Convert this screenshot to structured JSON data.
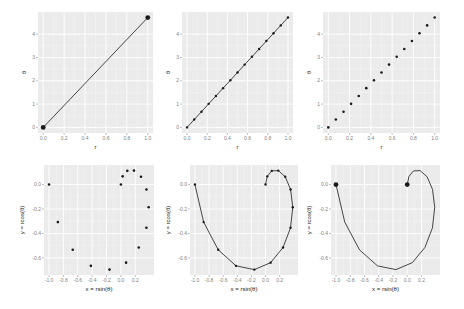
{
  "figure": {
    "panel_background": "#ebebeb",
    "grid_major_color": "#ffffff",
    "grid_minor_color": "#f5f5f5",
    "point_color": "#1a1a1a",
    "line_color": "#1a1a1a"
  },
  "chart_data": [
    {
      "id": "top-left",
      "type": "line",
      "title": "",
      "xlabel": "r",
      "ylabel": "θ",
      "xlim": [
        -0.05,
        1.05
      ],
      "ylim": [
        -0.24,
        4.95
      ],
      "xticks": [
        0.0,
        0.2,
        0.4,
        0.6,
        0.8,
        1.0
      ],
      "xtick_labels": [
        "0.0",
        "0.2",
        "0.4",
        "0.6",
        "0.8",
        "1.0"
      ],
      "yticks": [
        0,
        1,
        2,
        3,
        4
      ],
      "ytick_labels": [
        "0",
        "1",
        "2",
        "3",
        "4"
      ],
      "x": [
        0.0,
        1.0
      ],
      "y": [
        0.0,
        4.712
      ],
      "show_line": true,
      "show_points": true,
      "point_size": 2.4,
      "grid": true,
      "legend": "none"
    },
    {
      "id": "top-middle",
      "type": "line",
      "title": "",
      "xlabel": "r",
      "ylabel": "θ",
      "xlim": [
        -0.05,
        1.05
      ],
      "ylim": [
        -0.24,
        4.95
      ],
      "xticks": [
        0.0,
        0.2,
        0.4,
        0.6,
        0.8,
        1.0
      ],
      "xtick_labels": [
        "0.0",
        "0.2",
        "0.4",
        "0.6",
        "0.8",
        "1.0"
      ],
      "yticks": [
        0,
        1,
        2,
        3,
        4
      ],
      "ytick_labels": [
        "0",
        "1",
        "2",
        "3",
        "4"
      ],
      "x": [
        0.0,
        0.071,
        0.143,
        0.214,
        0.286,
        0.357,
        0.429,
        0.5,
        0.571,
        0.643,
        0.714,
        0.786,
        0.857,
        0.929,
        1.0
      ],
      "y": [
        0.0,
        0.337,
        0.673,
        1.01,
        1.346,
        1.683,
        2.02,
        2.356,
        2.693,
        3.029,
        3.366,
        3.703,
        4.039,
        4.376,
        4.712
      ],
      "show_line": true,
      "show_points": true,
      "point_size": 1.2,
      "grid": true,
      "legend": "none"
    },
    {
      "id": "top-right",
      "type": "scatter",
      "title": "",
      "xlabel": "r",
      "ylabel": "θ",
      "xlim": [
        -0.05,
        1.05
      ],
      "ylim": [
        -0.24,
        4.95
      ],
      "xticks": [
        0.0,
        0.2,
        0.4,
        0.6,
        0.8,
        1.0
      ],
      "xtick_labels": [
        "0.0",
        "0.2",
        "0.4",
        "0.6",
        "0.8",
        "1.0"
      ],
      "yticks": [
        0,
        1,
        2,
        3,
        4
      ],
      "ytick_labels": [
        "0",
        "1",
        "2",
        "3",
        "4"
      ],
      "x": [
        0.0,
        0.071,
        0.143,
        0.214,
        0.286,
        0.357,
        0.429,
        0.5,
        0.571,
        0.643,
        0.714,
        0.786,
        0.857,
        0.929,
        1.0
      ],
      "y": [
        0.0,
        0.337,
        0.673,
        1.01,
        1.346,
        1.683,
        2.02,
        2.356,
        2.693,
        3.029,
        3.366,
        3.703,
        4.039,
        4.376,
        4.712
      ],
      "show_line": false,
      "show_points": true,
      "point_size": 1.3,
      "grid": true,
      "legend": "none"
    },
    {
      "id": "bottom-left",
      "type": "scatter",
      "title": "",
      "xlabel": "x = rsin(θ)",
      "ylabel": "y = rcos(θ)",
      "xlim": [
        -1.07,
        0.46
      ],
      "ylim": [
        -0.74,
        0.16
      ],
      "xticks": [
        -1.0,
        -0.8,
        -0.6,
        -0.4,
        -0.2,
        0.0,
        0.2
      ],
      "xtick_labels": [
        "-1.0",
        "-0.8",
        "-0.6",
        "-0.4",
        "-0.2",
        "0.0",
        "0.2"
      ],
      "yticks": [
        0.0,
        -0.2,
        -0.4,
        -0.6
      ],
      "ytick_labels": [
        "0.0",
        "-0.2",
        "-0.4",
        "-0.6"
      ],
      "x": [
        0.0,
        0.024,
        0.089,
        0.181,
        0.279,
        0.355,
        0.386,
        0.354,
        0.248,
        0.072,
        -0.159,
        -0.418,
        -0.67,
        -0.877,
        -1.0
      ],
      "y": [
        0.0,
        0.067,
        0.112,
        0.114,
        0.064,
        -0.04,
        -0.186,
        -0.354,
        -0.515,
        -0.639,
        -0.696,
        -0.665,
        -0.534,
        -0.307,
        0.0
      ],
      "show_line": false,
      "show_points": true,
      "point_size": 1.3,
      "grid": true,
      "legend": "none"
    },
    {
      "id": "bottom-middle",
      "type": "line",
      "title": "",
      "xlabel": "x = rsin(θ)",
      "ylabel": "y = rcos(θ)",
      "xlim": [
        -1.07,
        0.46
      ],
      "ylim": [
        -0.74,
        0.16
      ],
      "xticks": [
        -1.0,
        -0.8,
        -0.6,
        -0.4,
        -0.2,
        0.0,
        0.2
      ],
      "xtick_labels": [
        "-1.0",
        "-0.8",
        "-0.6",
        "-0.4",
        "-0.2",
        "0.0",
        "0.2"
      ],
      "yticks": [
        0.0,
        -0.2,
        -0.4,
        -0.6
      ],
      "ytick_labels": [
        "0.0",
        "-0.2",
        "-0.4",
        "-0.6"
      ],
      "x": [
        0.0,
        0.024,
        0.089,
        0.181,
        0.279,
        0.355,
        0.386,
        0.354,
        0.248,
        0.072,
        -0.159,
        -0.418,
        -0.67,
        -0.877,
        -1.0
      ],
      "y": [
        0.0,
        0.067,
        0.112,
        0.114,
        0.064,
        -0.04,
        -0.186,
        -0.354,
        -0.515,
        -0.639,
        -0.696,
        -0.665,
        -0.534,
        -0.307,
        0.0
      ],
      "show_line": true,
      "show_points": true,
      "point_size": 1.2,
      "grid": true,
      "legend": "none"
    },
    {
      "id": "bottom-right",
      "type": "line",
      "title": "",
      "xlabel": "x = rsin(θ)",
      "ylabel": "y = rcos(θ)",
      "xlim": [
        -1.07,
        0.46
      ],
      "ylim": [
        -0.74,
        0.16
      ],
      "xticks": [
        -1.0,
        -0.8,
        -0.6,
        -0.4,
        -0.2,
        0.0,
        0.2
      ],
      "xtick_labels": [
        "-1.0",
        "-0.8",
        "-0.6",
        "-0.4",
        "-0.2",
        "0.0",
        "0.2"
      ],
      "yticks": [
        0.0,
        -0.2,
        -0.4,
        -0.6
      ],
      "ytick_labels": [
        "0.0",
        "-0.2",
        "-0.4",
        "-0.6"
      ],
      "x": [
        0.0,
        0.024,
        0.089,
        0.181,
        0.279,
        0.355,
        0.386,
        0.354,
        0.248,
        0.072,
        -0.159,
        -0.418,
        -0.67,
        -0.877,
        -1.0
      ],
      "y": [
        0.0,
        0.067,
        0.112,
        0.114,
        0.064,
        -0.04,
        -0.186,
        -0.354,
        -0.515,
        -0.639,
        -0.696,
        -0.665,
        -0.534,
        -0.307,
        0.0
      ],
      "show_line": true,
      "show_points": false,
      "endpoint_markers": true,
      "point_size": 2.4,
      "grid": true,
      "legend": "none"
    }
  ]
}
